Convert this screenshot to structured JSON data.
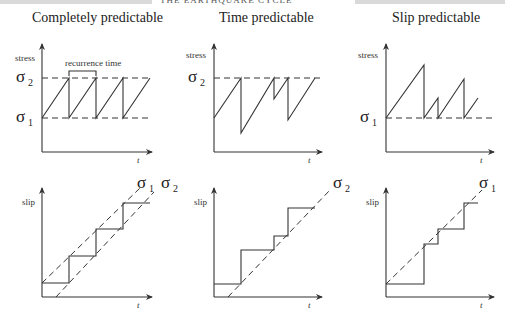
{
  "header": {
    "running_head": "THE EARTHQUAKE CYCLE"
  },
  "panels": [
    {
      "title": "Completely predictable",
      "stress_plot": {
        "ylabel": "stress",
        "xlabel": "t",
        "annotation": "recurrence time",
        "levels": [
          "σ",
          "σ"
        ],
        "level_subs": [
          "2",
          "1"
        ]
      },
      "slip_plot": {
        "ylabel": "slip",
        "xlabel": "t",
        "line_labels": [
          "σ",
          "σ"
        ],
        "line_subs": [
          "1",
          "2"
        ]
      }
    },
    {
      "title": "Time predictable",
      "stress_plot": {
        "ylabel": "stress",
        "xlabel": "t",
        "levels": [
          "σ"
        ],
        "level_subs": [
          "2"
        ]
      },
      "slip_plot": {
        "ylabel": "slip",
        "xlabel": "t",
        "line_labels": [
          "σ"
        ],
        "line_subs": [
          "2"
        ]
      }
    },
    {
      "title": "Slip predictable",
      "stress_plot": {
        "ylabel": "stress",
        "xlabel": "t",
        "levels": [
          "σ"
        ],
        "level_subs": [
          "1"
        ]
      },
      "slip_plot": {
        "ylabel": "slip",
        "xlabel": "t",
        "line_labels": [
          "σ"
        ],
        "line_subs": [
          "1"
        ]
      }
    }
  ]
}
